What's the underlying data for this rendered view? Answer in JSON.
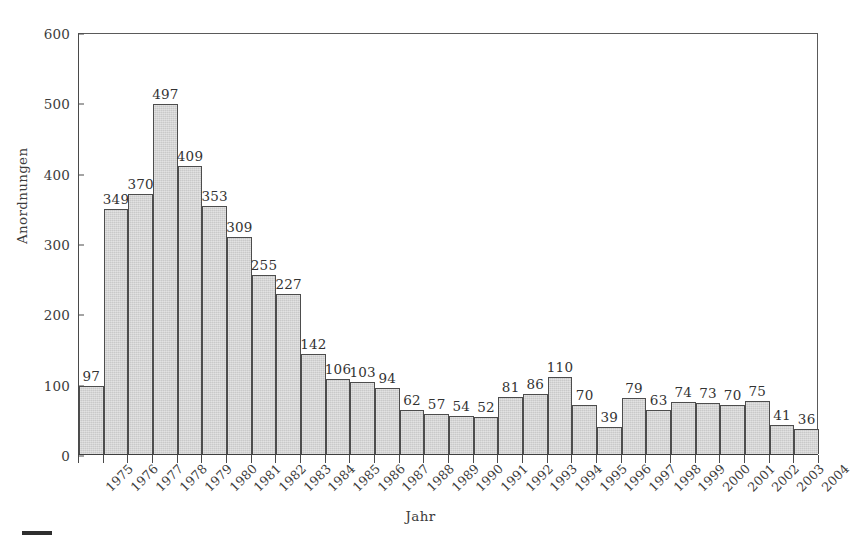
{
  "chart_data": {
    "type": "bar",
    "title": "",
    "xlabel": "Jahr",
    "ylabel": "Anordnungen",
    "ylim": [
      0,
      600
    ],
    "yticks": [
      0,
      100,
      200,
      300,
      400,
      500,
      600
    ],
    "grid": false,
    "legend": "none",
    "bar_labels_shown": true,
    "categories": [
      "1975",
      "1976",
      "1977",
      "1978",
      "1979",
      "1980",
      "1981",
      "1982",
      "1983",
      "1984",
      "1985",
      "1986",
      "1987",
      "1988",
      "1989",
      "1990",
      "1991",
      "1992",
      "1993",
      "1994",
      "1995",
      "1996",
      "1997",
      "1998",
      "1999",
      "2000",
      "2001",
      "2002",
      "2003",
      "2004"
    ],
    "values": [
      97,
      349,
      370,
      497,
      409,
      353,
      309,
      255,
      227,
      142,
      106,
      103,
      94,
      62,
      57,
      54,
      52,
      81,
      86,
      110,
      70,
      39,
      79,
      63,
      74,
      73,
      70,
      75,
      41,
      36
    ]
  },
  "style": {
    "bar_fill": "#c9c9c9",
    "bar_stroke": "#4d4d4d",
    "axis_color": "#4a4a4a",
    "text_color": "#3c3c3c",
    "background": "#ffffff"
  }
}
